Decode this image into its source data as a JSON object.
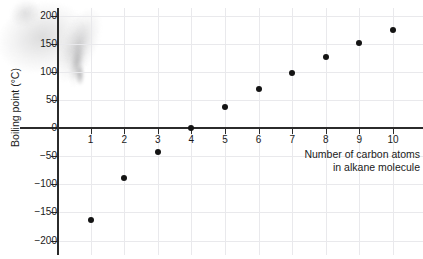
{
  "chart_data": {
    "type": "scatter",
    "title": "",
    "xlabel": "Number of carbon atoms in alkane molecule",
    "xlabel_lines": [
      "Number of carbon atoms",
      "in alkane molecule"
    ],
    "ylabel": "Boiling point (°C)",
    "x": [
      1,
      2,
      3,
      4,
      5,
      6,
      7,
      8,
      9,
      10
    ],
    "values": [
      -164,
      -89,
      -43,
      0,
      37,
      69,
      98,
      126,
      151,
      175
    ],
    "xlim": [
      0,
      10.6
    ],
    "ylim": [
      -200,
      200
    ],
    "xticks": [
      "1",
      "2",
      "3",
      "4",
      "5",
      "6",
      "7",
      "8",
      "9",
      "10"
    ],
    "yticks": [
      "200",
      "150",
      "100",
      "50",
      "0",
      "−50",
      "−100",
      "−150",
      "−200"
    ],
    "ytick_values": [
      200,
      150,
      100,
      50,
      0,
      -50,
      -100,
      -150,
      -200
    ],
    "grid": true,
    "legend": "none",
    "marker_color": "#141414",
    "axis_color": "#2b2b2b",
    "grid_color": "#e9e9ec"
  },
  "figure": {
    "background": "#ffffff",
    "artifact": "scan-smudge-top-left"
  }
}
